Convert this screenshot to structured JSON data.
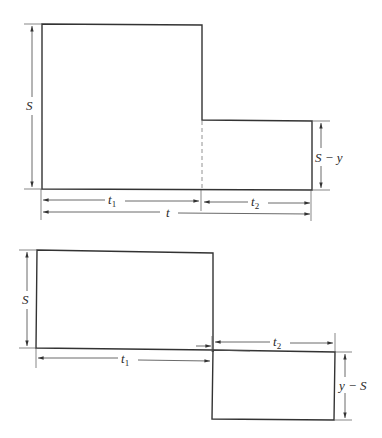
{
  "diagrams": [
    {
      "id": "top",
      "description": "Stepped profile: height S over t1, height S-y over t2; total span t",
      "labels": {
        "height_left": "S",
        "height_right": "S − y",
        "span_1": "t",
        "span_1_sub": "1",
        "span_2": "t",
        "span_2_sub": "2",
        "span_total": "t"
      }
    },
    {
      "id": "bottom",
      "description": "Profile: positive height S over t1, then negative rectangle of depth y-S over t2",
      "labels": {
        "height_left": "S",
        "depth_right": "y − S",
        "span_1": "t",
        "span_1_sub": "1",
        "span_2": "t",
        "span_2_sub": "2"
      }
    }
  ],
  "colors": {
    "stroke": "#333333",
    "background": "#ffffff"
  }
}
